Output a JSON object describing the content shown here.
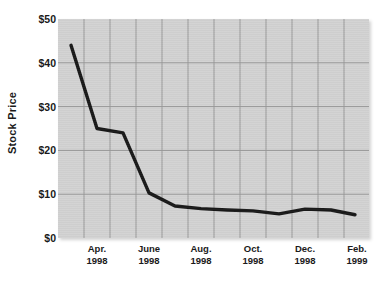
{
  "chart_data": {
    "type": "line",
    "title": "",
    "subtitle": "",
    "xlabel": "",
    "ylabel": "Stock Price",
    "ylim": [
      0,
      50
    ],
    "y_ticks": [
      0,
      10,
      20,
      30,
      40,
      50
    ],
    "y_tick_labels": [
      "$0",
      "$10",
      "$20",
      "$30",
      "$40",
      "$50"
    ],
    "x_tick_labels": [
      "Apr.\n1998",
      "June\n1998",
      "Aug.\n1998",
      "Oct.\n1998",
      "Dec.\n1998",
      "Feb.\n1999"
    ],
    "x_ticks_months": [
      "Apr.",
      "June",
      "Aug.",
      "Oct.",
      "Dec.",
      "Feb."
    ],
    "x_ticks_years": [
      "1998",
      "1998",
      "1998",
      "1998",
      "1998",
      "1999"
    ],
    "grid": true,
    "legend": "none",
    "line_color": "#181818",
    "plot_background": "#d2d2d2",
    "grid_color": "#9a9a9a",
    "x": [
      "Mar. 1998",
      "Apr. 1998",
      "May 1998",
      "June 1998",
      "July 1998",
      "Aug. 1998",
      "Sep. 1998",
      "Oct. 1998",
      "Nov. 1998",
      "Dec. 1998",
      "Jan. 1999",
      "Feb. 1999"
    ],
    "values": [
      44,
      25,
      24,
      10.3,
      7.3,
      6.7,
      6.4,
      6.2,
      5.5,
      6.6,
      6.4,
      5.3
    ],
    "series": [
      {
        "name": "Stock Price",
        "values": [
          44,
          25,
          24,
          10.3,
          7.3,
          6.7,
          6.4,
          6.2,
          5.5,
          6.6,
          6.4,
          5.3
        ]
      }
    ],
    "points_px": [
      [
        13,
        44
      ],
      [
        39,
        25
      ],
      [
        65,
        24
      ],
      [
        91,
        10.3
      ],
      [
        117,
        7.3
      ],
      [
        143,
        6.7
      ],
      [
        169,
        6.4
      ],
      [
        195,
        6.2
      ],
      [
        221,
        5.5
      ],
      [
        247,
        6.6
      ],
      [
        273,
        6.4
      ],
      [
        297,
        5.3
      ]
    ]
  },
  "axis": {
    "y_title": "Stock Price"
  }
}
